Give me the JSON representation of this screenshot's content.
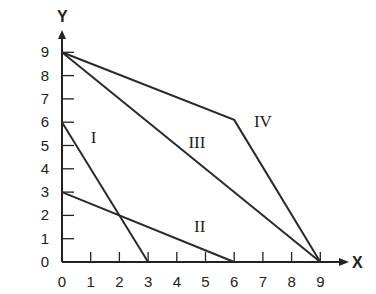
{
  "chart_data": {
    "type": "line",
    "title": "",
    "xlabel": "X",
    "ylabel": "Y",
    "xlim": [
      0,
      9
    ],
    "ylim": [
      0,
      9
    ],
    "x_ticks": [
      0,
      1,
      2,
      3,
      4,
      5,
      6,
      7,
      8,
      9
    ],
    "y_ticks": [
      0,
      1,
      2,
      3,
      4,
      5,
      6,
      7,
      8,
      9
    ],
    "grid": false,
    "legend": "none (lines labeled inline)",
    "series": [
      {
        "name": "I",
        "points": [
          [
            0,
            6
          ],
          [
            3,
            0
          ]
        ],
        "label_pos": [
          1.1,
          5.1
        ]
      },
      {
        "name": "II",
        "points": [
          [
            0,
            3
          ],
          [
            6,
            0
          ]
        ],
        "label_pos": [
          4.8,
          1.3
        ]
      },
      {
        "name": "III",
        "points": [
          [
            0,
            9
          ],
          [
            9,
            0
          ]
        ],
        "label_pos": [
          4.7,
          4.9
        ]
      },
      {
        "name": "IV",
        "points": [
          [
            0,
            9
          ],
          [
            6,
            6.1
          ],
          [
            9,
            0
          ]
        ],
        "label_pos": [
          7.0,
          5.8
        ]
      }
    ]
  },
  "axes": {
    "x_name": "X",
    "y_name": "Y"
  }
}
